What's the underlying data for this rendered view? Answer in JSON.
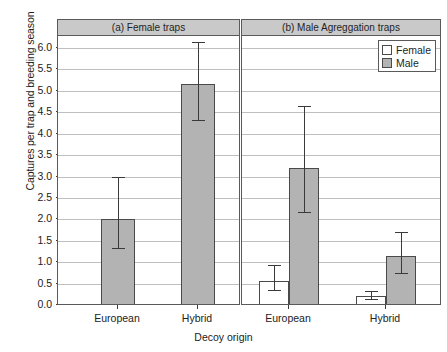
{
  "chart_data": {
    "type": "bar",
    "title": "",
    "xlabel": "Decoy origin",
    "ylabel": "Captures per trap and breeding season",
    "ylim": [
      0.0,
      6.0
    ],
    "ytick_labels": [
      "0.0",
      "0.5",
      "1.0",
      "1.5",
      "2.0",
      "2.5",
      "3.0",
      "3.5",
      "4.0",
      "4.5",
      "5.0",
      "5.5",
      "6.0"
    ],
    "ytick_values": [
      0.0,
      0.5,
      1.0,
      1.5,
      2.0,
      2.5,
      3.0,
      3.5,
      4.0,
      4.5,
      5.0,
      5.5,
      6.0
    ],
    "grid": "horizontal",
    "legend_position": "top-right",
    "legend": [
      {
        "name": "Female",
        "color": "#ffffff"
      },
      {
        "name": "Male",
        "color": "#b3b3b3"
      }
    ],
    "panels": [
      {
        "id": "a",
        "title": "(a) Female traps",
        "categories": [
          "European",
          "Hybrid"
        ],
        "bars": [
          {
            "category": "European",
            "series": "Male",
            "value": 2.0,
            "err_low": 1.32,
            "err_high": 3.0
          },
          {
            "category": "Hybrid",
            "series": "Male",
            "value": 5.15,
            "err_low": 4.31,
            "err_high": 6.15
          }
        ]
      },
      {
        "id": "b",
        "title": "(b) Male Agreggation traps",
        "categories": [
          "European",
          "Hybrid"
        ],
        "bars": [
          {
            "category": "European",
            "series": "Female",
            "value": 0.57,
            "err_low": 0.34,
            "err_high": 0.94
          },
          {
            "category": "European",
            "series": "Male",
            "value": 3.2,
            "err_low": 2.18,
            "err_high": 4.64
          },
          {
            "category": "Hybrid",
            "series": "Female",
            "value": 0.2,
            "err_low": 0.13,
            "err_high": 0.32
          },
          {
            "category": "Hybrid",
            "series": "Male",
            "value": 1.14,
            "err_low": 0.75,
            "err_high": 1.7
          }
        ]
      }
    ],
    "colors": {
      "male_fill": "#b3b3b3",
      "female_fill": "#ffffff",
      "strip_fill": "#c9c9c9",
      "grid": "#bfbfbf",
      "axis": "#3a3a3a"
    }
  }
}
